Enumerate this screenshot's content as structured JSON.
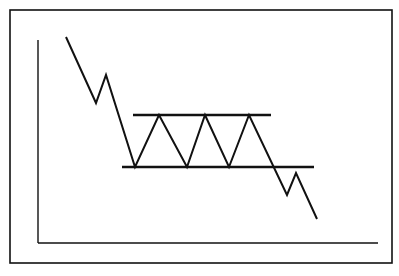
{
  "chart_data": {
    "type": "line",
    "title": "",
    "subtitle": "",
    "xlabel": "",
    "ylabel": "",
    "pattern": "rectangle (trading range) with downside breakout",
    "grid": false,
    "legend": null,
    "frame": {
      "x": 10,
      "y": 10,
      "width": 382,
      "height": 253
    },
    "axes": {
      "y_axis": {
        "x": 38,
        "y1": 40,
        "y2": 243
      },
      "x_axis": {
        "y": 243,
        "x1": 38,
        "x2": 378
      }
    },
    "price_path": [
      {
        "x": 66,
        "y": 37
      },
      {
        "x": 96,
        "y": 103
      },
      {
        "x": 106,
        "y": 75
      },
      {
        "x": 135,
        "y": 167
      },
      {
        "x": 159,
        "y": 115
      },
      {
        "x": 187,
        "y": 167
      },
      {
        "x": 205,
        "y": 115
      },
      {
        "x": 229,
        "y": 167
      },
      {
        "x": 249,
        "y": 115
      },
      {
        "x": 287,
        "y": 195
      },
      {
        "x": 296,
        "y": 173
      },
      {
        "x": 317,
        "y": 219
      }
    ],
    "resistance_line": {
      "x1": 133,
      "y1": 115,
      "x2": 271,
      "y2": 115,
      "label": ""
    },
    "support_line": {
      "x1": 122,
      "y1": 167,
      "x2": 314,
      "y2": 167,
      "label": ""
    }
  },
  "colors": {
    "ink": "#111111",
    "background": "#ffffff"
  }
}
